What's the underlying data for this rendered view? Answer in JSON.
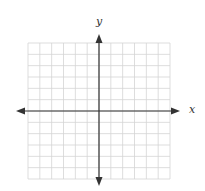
{
  "diagram": {
    "type": "cartesian-grid",
    "x_label": "x",
    "y_label": "y",
    "grid": {
      "columns": 12,
      "rows": 12,
      "cells_left_of_y_axis": 6,
      "cells_right_of_y_axis": 6,
      "cells_above_x_axis": 6,
      "cells_below_x_axis": 6
    },
    "colors": {
      "grid_line": "#d4d4d4",
      "axis": "#333333",
      "label": "#333333"
    }
  }
}
